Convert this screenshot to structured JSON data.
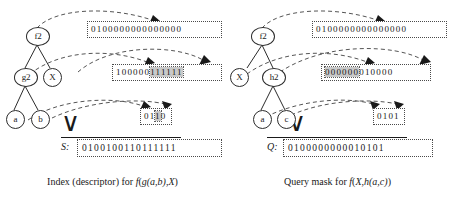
{
  "figure": {
    "panels": [
      {
        "id": "index",
        "caption_plain": "Index (descriptor) for f(g(a,b),X)",
        "caption_prefix": "Index (descriptor) for ",
        "caption_f": "f",
        "caption_open": "(",
        "caption_g": "g",
        "caption_args": "(a,b)",
        "caption_comma": ",",
        "caption_var": "X",
        "caption_close": ")",
        "tree": {
          "nodes": [
            {
              "id": "root",
              "label": "f2"
            },
            {
              "id": "child1",
              "label": "g2"
            },
            {
              "id": "child2",
              "label": "X"
            },
            {
              "id": "leaf1",
              "label": "a"
            },
            {
              "id": "leaf2",
              "label": "b"
            }
          ]
        },
        "bit_boxes": [
          {
            "id": "box-root",
            "segments": [
              {
                "bits": "0100000000000000",
                "shaded": false
              }
            ]
          },
          {
            "id": "box-mid",
            "segments": [
              {
                "bits": "100000",
                "shaded": false
              },
              {
                "bits": "111111",
                "shaded": true
              }
            ]
          },
          {
            "id": "box-leaf",
            "segments": [
              {
                "bits": "01",
                "shaded": false
              },
              {
                "bits": "1",
                "shaded": true
              },
              {
                "bits": "0",
                "shaded": false
              }
            ]
          }
        ],
        "result": {
          "label": "S:",
          "bits": "0100100110111111"
        },
        "or_symbol": "∨"
      },
      {
        "id": "query",
        "caption_plain": "Query mask for f(X,h(a,c))",
        "caption_prefix": "Query mask for ",
        "caption_f": "f",
        "caption_open": "(",
        "caption_var": "X",
        "caption_comma": ",",
        "caption_g": "h",
        "caption_args": "(a,c)",
        "caption_close": ")",
        "tree": {
          "nodes": [
            {
              "id": "root",
              "label": "f2"
            },
            {
              "id": "child1",
              "label": "X"
            },
            {
              "id": "child2",
              "label": "h2"
            },
            {
              "id": "leaf1",
              "label": "a"
            },
            {
              "id": "leaf2",
              "label": "c"
            }
          ]
        },
        "bit_boxes": [
          {
            "id": "box-root",
            "segments": [
              {
                "bits": "0100000000000000",
                "shaded": false
              }
            ]
          },
          {
            "id": "box-mid",
            "segments": [
              {
                "bits": "000000",
                "shaded": true
              },
              {
                "bits": "010000",
                "shaded": false
              }
            ]
          },
          {
            "id": "box-leaf",
            "segments": [
              {
                "bits": "01",
                "shaded": false
              },
              {
                "bits": "0",
                "shaded": false
              },
              {
                "bits": "1",
                "shaded": false
              }
            ]
          }
        ],
        "result": {
          "label": "Q:",
          "bits": "0100000000010101"
        },
        "or_symbol": "∨"
      }
    ]
  }
}
